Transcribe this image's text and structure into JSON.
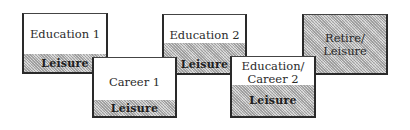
{
  "diagram": {
    "type": "life-stage-sequence",
    "stages": [
      {
        "id": "education-1",
        "title": "Education 1",
        "band": "Leisure"
      },
      {
        "id": "career-1",
        "title": "Career 1",
        "band": "Leisure"
      },
      {
        "id": "education-2",
        "title": "Education 2",
        "band": "Leisure"
      },
      {
        "id": "education-career-2",
        "title_line1": "Education/",
        "title_line2": "Career 2",
        "band": "Leisure"
      },
      {
        "id": "retire-leisure",
        "title_line1": "Retire/",
        "title_line2": "Leisure"
      }
    ],
    "colors": {
      "border": "#2a2a2a",
      "hatch": "#c9c9c9",
      "background": "#ffffff"
    }
  }
}
